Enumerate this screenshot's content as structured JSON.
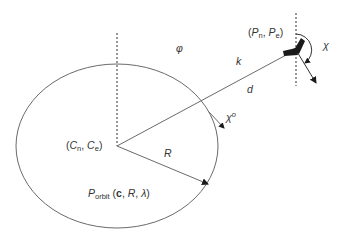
{
  "diagram": {
    "colors": {
      "stroke": "#6a6a6a",
      "text": "#333333",
      "aircraft": "#1a1a1a",
      "background": "#ffffff"
    },
    "labels": {
      "phi": "φ",
      "k": "k",
      "d": "d",
      "R": "R",
      "chi": "χ",
      "chi_orbit_base": "χ",
      "chi_orbit_sup": "o",
      "aircraft_pos_open": "(",
      "aircraft_pos_Pn": "P",
      "aircraft_pos_Pn_sub": "n",
      "aircraft_pos_sep": ", ",
      "aircraft_pos_Pe": "P",
      "aircraft_pos_Pe_sub": "e",
      "aircraft_pos_close": ")",
      "center_open": "(",
      "center_Cn": "C",
      "center_Cn_sub": "n",
      "center_sep": ", ",
      "center_Ce": "C",
      "center_Ce_sub": "e",
      "center_close": ")",
      "orbit_P": "P",
      "orbit_sub": "orbit",
      "orbit_args_open": " (",
      "orbit_c": "c",
      "orbit_args_mid": ", ",
      "orbit_R": "R",
      "orbit_args_sep": ", ",
      "orbit_lambda": "λ",
      "orbit_args_close": ")"
    },
    "elements": [
      "orbit-circle",
      "center-north-reference-dashed-line",
      "aircraft-north-reference-dashed-line",
      "center-to-aircraft-line",
      "radius-arrow",
      "aircraft-heading-arrow",
      "course-angle-arc",
      "orbit-tangent-course-arrow",
      "aircraft-icon"
    ]
  }
}
